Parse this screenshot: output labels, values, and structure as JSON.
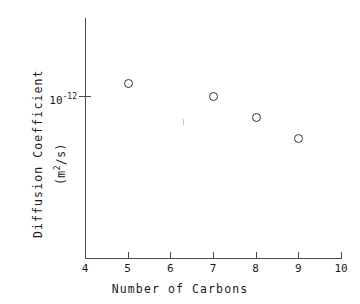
{
  "chart_data": {
    "type": "scatter",
    "title": "",
    "xlabel": "Number of Carbons",
    "ylabel": "Diffusion Coefficient",
    "ylabel_units": "(m2/s)",
    "yscale": "log",
    "xscale": "linear",
    "xlim": [
      4,
      10
    ],
    "ylim": [
      2.8e-13,
      2.2e-12
    ],
    "grid": false,
    "legend": "none",
    "xticks": [
      4,
      5,
      6,
      7,
      8,
      9,
      10
    ],
    "xticklabels": [
      "4",
      "5",
      "6",
      "7",
      "8",
      "9",
      "10"
    ],
    "yticks": [
      1e-12
    ],
    "yticklabels": [
      "10-12"
    ],
    "ytick_mantissa": "10",
    "ytick_exponent": "-12",
    "marker": "open-circle",
    "x": [
      5,
      7,
      8,
      9
    ],
    "y": [
      1.2e-12,
      1e-12,
      7.5e-13,
      5.7e-13
    ],
    "points": [
      {
        "label": "pentane",
        "carbons": 5,
        "value": 1.2e-12
      },
      {
        "label": "heptane",
        "carbons": 7,
        "value": 1e-12
      },
      {
        "label": "octane",
        "carbons": 8,
        "value": 7.5e-13
      },
      {
        "label": "nonane",
        "carbons": 9,
        "value": 5.7e-13
      }
    ]
  },
  "figure": {
    "axis_color": "#4a4a4a",
    "marker_color": "#333333",
    "background": "#ffffff"
  }
}
